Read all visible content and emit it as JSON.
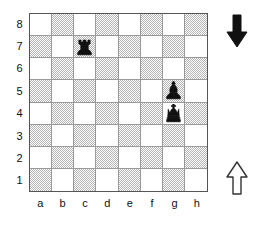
{
  "diagram": {
    "name": "chess-position-diagram",
    "board_size": 8,
    "orientation": "white-bottom",
    "colors": {
      "light_square": "#ffffff",
      "dark_square": "#b4b4b4",
      "border": "#555555",
      "grid_line": "#9a9a9a",
      "black_piece": "#111111",
      "white_piece": "#ffffff",
      "label": "#111111"
    }
  },
  "labels": {
    "ranks": [
      "8",
      "7",
      "6",
      "5",
      "4",
      "3",
      "2",
      "1"
    ],
    "files": [
      "a",
      "b",
      "c",
      "d",
      "e",
      "f",
      "g",
      "h"
    ]
  },
  "squares": {
    "shades": [
      [
        "light",
        "dark",
        "light",
        "dark",
        "light",
        "dark",
        "light",
        "dark"
      ],
      [
        "dark",
        "light",
        "dark",
        "light",
        "dark",
        "light",
        "dark",
        "light"
      ],
      [
        "light",
        "dark",
        "light",
        "dark",
        "light",
        "dark",
        "light",
        "dark"
      ],
      [
        "dark",
        "light",
        "dark",
        "light",
        "dark",
        "light",
        "dark",
        "light"
      ],
      [
        "light",
        "dark",
        "light",
        "dark",
        "light",
        "dark",
        "light",
        "dark"
      ],
      [
        "dark",
        "light",
        "dark",
        "light",
        "dark",
        "light",
        "dark",
        "light"
      ],
      [
        "light",
        "dark",
        "light",
        "dark",
        "light",
        "dark",
        "light",
        "dark"
      ],
      [
        "dark",
        "light",
        "dark",
        "light",
        "dark",
        "light",
        "dark",
        "light"
      ]
    ]
  },
  "pieces": [
    {
      "square": "c7",
      "file": "c",
      "rank": "7",
      "col": 2,
      "row": 1,
      "color": "black",
      "type": "rook",
      "icon": "black-rook-icon",
      "glyph": "♜"
    },
    {
      "square": "g5",
      "file": "g",
      "rank": "5",
      "col": 6,
      "row": 3,
      "color": "black",
      "type": "bishop",
      "icon": "black-bishop-icon",
      "glyph": "♝"
    },
    {
      "square": "g4",
      "file": "g",
      "rank": "4",
      "col": 6,
      "row": 4,
      "color": "black",
      "type": "king",
      "icon": "black-king-icon",
      "glyph": "♚"
    }
  ],
  "arrows": [
    {
      "id": "top",
      "name": "black-direction-arrow",
      "direction": "down",
      "fill": "#111111",
      "stroke": "#111111",
      "meaning": "black"
    },
    {
      "id": "bottom",
      "name": "white-direction-arrow",
      "direction": "up",
      "fill": "#ffffff",
      "stroke": "#333333",
      "meaning": "white"
    }
  ]
}
